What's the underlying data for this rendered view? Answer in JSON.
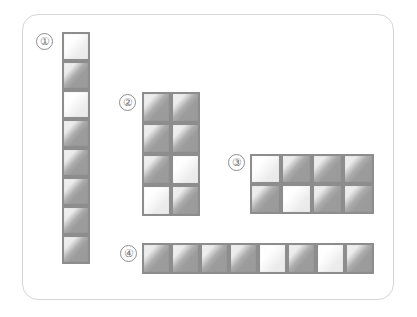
{
  "figure": {
    "background_color": "#ffffff",
    "frame": {
      "name": "rounded-card-frame",
      "border_color": "#d6d6d6",
      "corner_radius": "16px"
    },
    "tile_colors": {
      "dark": "#9a9a9a",
      "light": "#e9e9e9",
      "border": "#8d8d8d"
    }
  },
  "groups": [
    {
      "id": "group-1",
      "label": "①",
      "label_text": "1",
      "shape": "vertical-column",
      "columns": 1,
      "rows": 8,
      "tile_count": 8,
      "light_tile_count": 2,
      "dark_tile_count": 6,
      "light_positions": [
        1,
        3
      ],
      "tones": [
        "light",
        "dark",
        "light",
        "dark",
        "dark",
        "dark",
        "dark",
        "dark"
      ]
    },
    {
      "id": "group-2",
      "label": "②",
      "label_text": "2",
      "shape": "grid-2x4",
      "columns": 2,
      "rows": 4,
      "tile_count": 8,
      "light_tile_count": 2,
      "dark_tile_count": 6,
      "light_positions": [
        6,
        7
      ],
      "tones": [
        "dark",
        "dark",
        "dark",
        "dark",
        "dark",
        "light",
        "light",
        "dark"
      ]
    },
    {
      "id": "group-3",
      "label": "③",
      "label_text": "3",
      "shape": "grid-4x2",
      "columns": 4,
      "rows": 2,
      "tile_count": 8,
      "light_tile_count": 2,
      "dark_tile_count": 6,
      "light_positions": [
        1,
        6
      ],
      "tones": [
        "light",
        "dark",
        "dark",
        "dark",
        "dark",
        "light",
        "dark",
        "dark"
      ]
    },
    {
      "id": "group-4",
      "label": "④",
      "label_text": "4",
      "shape": "horizontal-row",
      "columns": 8,
      "rows": 1,
      "tile_count": 8,
      "light_tile_count": 2,
      "dark_tile_count": 6,
      "light_positions": [
        5,
        7
      ],
      "tones": [
        "dark",
        "dark",
        "dark",
        "dark",
        "light",
        "dark",
        "light",
        "dark"
      ]
    }
  ]
}
